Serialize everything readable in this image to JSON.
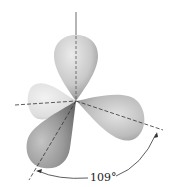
{
  "diagram": {
    "lobes": [
      {
        "name": "top",
        "shade": "light-mid"
      },
      {
        "name": "left-back",
        "shade": "light"
      },
      {
        "name": "right",
        "shade": "mid"
      },
      {
        "name": "bottom-left-front",
        "shade": "dark"
      }
    ],
    "angle_label": "109°",
    "colors": {
      "background": "#ffffff",
      "line": "#333333",
      "lobe_light": "#e6e6e6",
      "lobe_mid": "#b8b8b8",
      "lobe_dark": "#8a8a8a"
    }
  }
}
